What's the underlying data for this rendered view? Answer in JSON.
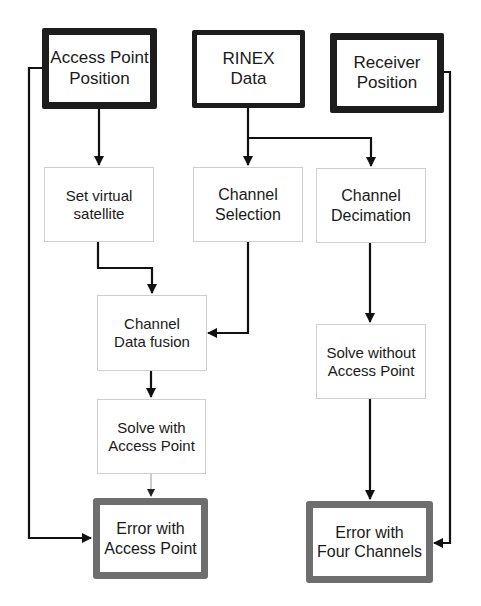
{
  "diagram": {
    "type": "flowchart",
    "colors": {
      "input_border": "#1c1c1c",
      "process_border": "#cfcfcf",
      "output_border": "#6e6e6e",
      "connector": "#111111",
      "thin_connector": "#9a9a9a",
      "background": "#ffffff"
    },
    "nodes": {
      "access_point_position": {
        "label": "Access Point\nPosition",
        "kind": "input"
      },
      "rinex_data": {
        "label": "RINEX\nData",
        "kind": "input"
      },
      "receiver_position": {
        "label": "Receiver\nPosition",
        "kind": "input"
      },
      "set_virtual_satellite": {
        "label": "Set virtual\nsatellite",
        "kind": "process"
      },
      "channel_selection": {
        "label": "Channel\nSelection",
        "kind": "process"
      },
      "channel_decimation": {
        "label": "Channel\nDecimation",
        "kind": "process"
      },
      "channel_data_fusion": {
        "label": "Channel\nData fusion",
        "kind": "process"
      },
      "solve_without_access_point": {
        "label": "Solve without\nAccess Point",
        "kind": "process"
      },
      "solve_with_access_point": {
        "label": "Solve with\nAccess Point",
        "kind": "process"
      },
      "error_with_access_point": {
        "label": "Error with\nAccess Point",
        "kind": "output"
      },
      "error_with_four_channels": {
        "label": "Error with\nFour Channels",
        "kind": "output"
      }
    },
    "edges": [
      {
        "from": "access_point_position",
        "to": "set_virtual_satellite"
      },
      {
        "from": "access_point_position",
        "to": "error_with_access_point"
      },
      {
        "from": "rinex_data",
        "to": "channel_selection"
      },
      {
        "from": "rinex_data",
        "to": "channel_decimation"
      },
      {
        "from": "receiver_position",
        "to": "error_with_four_channels"
      },
      {
        "from": "set_virtual_satellite",
        "to": "channel_data_fusion"
      },
      {
        "from": "channel_selection",
        "to": "channel_data_fusion"
      },
      {
        "from": "channel_data_fusion",
        "to": "solve_with_access_point"
      },
      {
        "from": "solve_with_access_point",
        "to": "error_with_access_point"
      },
      {
        "from": "channel_decimation",
        "to": "solve_without_access_point"
      },
      {
        "from": "solve_without_access_point",
        "to": "error_with_four_channels"
      }
    ]
  }
}
